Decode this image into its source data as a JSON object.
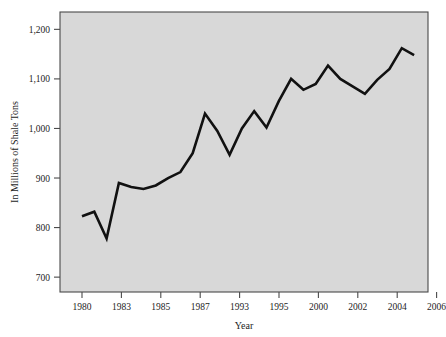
{
  "chart_data": {
    "type": "line",
    "title": "",
    "xlabel": "Year",
    "ylabel": "In Millions of Shale Tons",
    "xlim": [
      1980,
      2007
    ],
    "ylim": [
      670,
      1235
    ],
    "grid": false,
    "legend": null,
    "y_ticks": [
      700,
      800,
      900,
      1000,
      1100,
      1200
    ],
    "y_tick_labels": [
      "700",
      "800",
      "900",
      "1,000",
      "1,100",
      "1,200"
    ],
    "x_ticks": [
      1980,
      1983,
      1985,
      1987,
      1993,
      1995,
      2000,
      2002,
      2004,
      2006
    ],
    "x_tick_labels": [
      "1980",
      "1983",
      "1985",
      "1987",
      "1993",
      "1995",
      "2000",
      "2002",
      "2004",
      "2006"
    ],
    "x": [
      1980,
      1981,
      1982,
      1983,
      1984,
      1985,
      1986,
      1987,
      1988,
      1989,
      1990,
      1991,
      1992,
      1993,
      1994,
      1995,
      1996,
      1997,
      1998,
      1999,
      2000,
      2001,
      2002,
      2003,
      2004,
      2005,
      2006,
      2007
    ],
    "values": [
      823,
      832,
      778,
      890,
      882,
      878,
      885,
      900,
      912,
      950,
      1030,
      995,
      947,
      1000,
      1035,
      1002,
      1055,
      1100,
      1078,
      1090,
      1127,
      1100,
      1085,
      1070,
      1098,
      1120,
      1162,
      1148
    ],
    "series": [
      {
        "name": "Shale tons",
        "color": "#111111",
        "values": [
          823,
          832,
          778,
          890,
          882,
          878,
          885,
          900,
          912,
          950,
          1030,
          995,
          947,
          1000,
          1035,
          1002,
          1055,
          1100,
          1078,
          1090,
          1127,
          1100,
          1085,
          1070,
          1098,
          1120,
          1162,
          1148
        ]
      }
    ],
    "colors": {
      "plot_background": "#d8d8d8",
      "frame": "#4a4a4a",
      "line": "#111111",
      "text": "#1d1d1d",
      "page_background": "#ffffff"
    }
  }
}
